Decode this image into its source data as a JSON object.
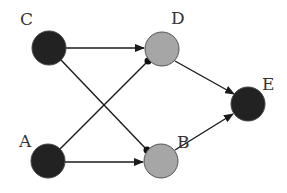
{
  "diagram": {
    "type": "directed-graph",
    "colors": {
      "dark_node": "#222222",
      "light_node": "#a6a6a6",
      "node_stroke": "#555555",
      "edge": "#1a1a1a"
    },
    "nodes": [
      {
        "id": "C",
        "label": "C",
        "fill": "dark",
        "x": 49,
        "y": 48
      },
      {
        "id": "D",
        "label": "D",
        "fill": "light",
        "x": 162,
        "y": 49
      },
      {
        "id": "E",
        "label": "E",
        "fill": "dark",
        "x": 248,
        "y": 104
      },
      {
        "id": "A",
        "label": "A",
        "fill": "dark",
        "x": 48,
        "y": 161
      },
      {
        "id": "B",
        "label": "B",
        "fill": "light",
        "x": 161,
        "y": 161
      }
    ],
    "edges": [
      {
        "from": "C",
        "to": "D",
        "head": "arrow"
      },
      {
        "from": "C",
        "to": "B",
        "head": "dot"
      },
      {
        "from": "A",
        "to": "D",
        "head": "dot"
      },
      {
        "from": "A",
        "to": "B",
        "head": "arrow"
      },
      {
        "from": "D",
        "to": "E",
        "head": "arrow"
      },
      {
        "from": "B",
        "to": "E",
        "head": "arrow"
      }
    ]
  }
}
